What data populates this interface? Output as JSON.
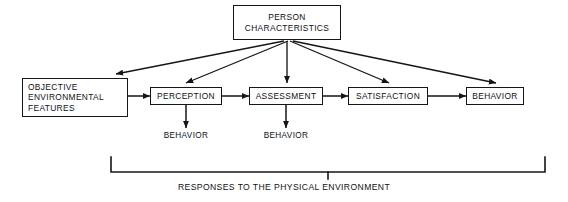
{
  "diagram": {
    "title_text": "PERSON CHARACTERISTICS",
    "nodes": {
      "person_characteristics": "PERSON\nCHARACTERISTICS",
      "objective_environmental_features": "OBJECTIVE\nENVIRONMENTAL\nFEATURES",
      "perception": "PERCEPTION",
      "assessment": "ASSESSMENT",
      "satisfaction": "SATISFACTION",
      "behavior_terminal": "BEHAVIOR"
    },
    "leaf_labels": {
      "behavior_from_perception": "BEHAVIOR",
      "behavior_from_assessment": "BEHAVIOR"
    },
    "bracket": {
      "caption": "RESPONSES TO THE PHYSICAL ENVIRONMENT"
    },
    "colors": {
      "stroke": "#15161a",
      "text": "#101114",
      "background": "#ffffff"
    }
  }
}
